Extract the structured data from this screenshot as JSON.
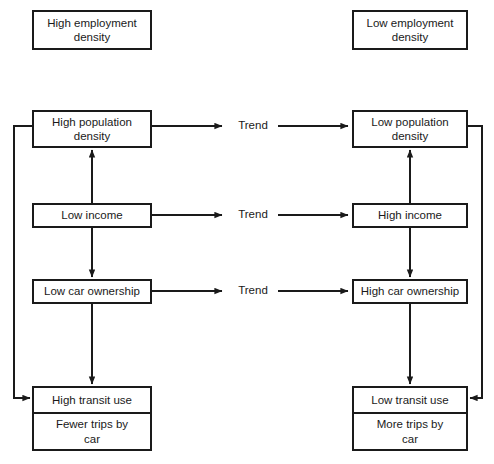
{
  "diagram": {
    "background_color": "#ffffff",
    "line_color": "#1a1a1a",
    "columns": {
      "left_header": "High employment\ndensity",
      "right_header": "Low employment\ndensity"
    },
    "nodes": {
      "high_employment_density": "High employment\ndensity",
      "low_employment_density": "Low employment\ndensity",
      "high_population_density": "High population\ndensity",
      "low_population_density": "Low population\ndensity",
      "low_income": "Low income",
      "high_income": "High income",
      "low_car_ownership": "Low car ownership",
      "high_car_ownership": "High car ownership",
      "high_transit_use": "High transit use",
      "fewer_trips_by_car": "Fewer trips by\ncar",
      "low_transit_use": "Low transit use",
      "more_trips_by_car": "More trips by\ncar"
    },
    "trend_labels": {
      "population": "Trend",
      "income": "Trend",
      "car_ownership": "Trend"
    }
  }
}
